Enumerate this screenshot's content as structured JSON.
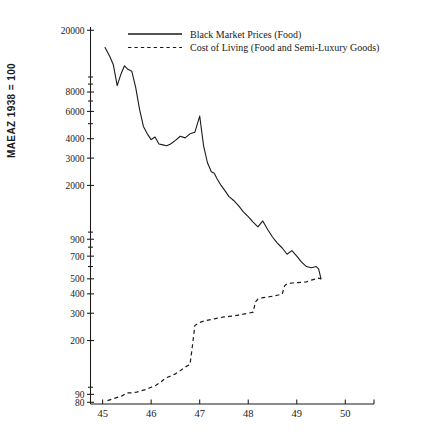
{
  "chart_data": {
    "type": "line",
    "title": "",
    "subtitle": "",
    "xlabel": "",
    "ylabel": "MAEAZ 1938 = 100",
    "yscale": "log",
    "xlim": [
      44.75,
      50.2
    ],
    "ylim": [
      78,
      21000
    ],
    "grid": false,
    "legend_position": "top-center",
    "x_ticks": [
      "45",
      "46",
      "47",
      "48",
      "49",
      "50"
    ],
    "x_tick_values": [
      45,
      46,
      47,
      48,
      49,
      50
    ],
    "y_ticks": [
      "20000",
      "8000",
      "6000",
      "4000",
      "3000",
      "2000",
      "900",
      "700",
      "500",
      "400",
      "300",
      "200",
      "90",
      "80"
    ],
    "y_tick_values": [
      20000,
      8000,
      6000,
      4000,
      3000,
      2000,
      900,
      700,
      500,
      400,
      300,
      200,
      90,
      80
    ],
    "y_minor_tick_values": [
      10000,
      9000,
      7000,
      5000,
      1000,
      800,
      600,
      100
    ],
    "series": [
      {
        "name": "Black Market Prices (Food)",
        "style": "solid",
        "color": "#1a1a1a",
        "x": [
          45.05,
          45.15,
          45.22,
          45.3,
          45.38,
          45.45,
          45.52,
          45.6,
          45.68,
          45.76,
          45.84,
          45.92,
          46.0,
          46.08,
          46.16,
          46.24,
          46.32,
          46.4,
          46.5,
          46.6,
          46.7,
          46.8,
          46.9,
          47.0,
          47.08,
          47.16,
          47.24,
          47.3,
          47.36,
          47.44,
          47.52,
          47.6,
          47.7,
          47.8,
          47.9,
          48.0,
          48.1,
          48.2,
          48.3,
          48.4,
          48.5,
          48.6,
          48.7,
          48.8,
          48.9,
          49.0,
          49.1,
          49.2,
          49.3,
          49.4,
          49.45,
          49.5
        ],
        "y": [
          15500,
          13500,
          12000,
          8800,
          10500,
          11800,
          11200,
          10900,
          8600,
          6200,
          4800,
          4300,
          3950,
          4100,
          3700,
          3650,
          3600,
          3700,
          3900,
          4150,
          4050,
          4300,
          4400,
          5600,
          3600,
          2800,
          2450,
          2400,
          2200,
          2000,
          1850,
          1700,
          1600,
          1480,
          1350,
          1260,
          1160,
          1080,
          1180,
          1040,
          930,
          850,
          790,
          720,
          760,
          700,
          640,
          600,
          590,
          600,
          580,
          500
        ]
      },
      {
        "name": "Cost of Living (Food and Semi-Luxury Goods)",
        "style": "dashed",
        "color": "#1a1a1a",
        "x": [
          45.1,
          45.2,
          45.3,
          45.4,
          45.5,
          45.6,
          45.7,
          45.8,
          45.9,
          46.0,
          46.1,
          46.2,
          46.3,
          46.4,
          46.5,
          46.6,
          46.7,
          46.8,
          46.85,
          46.9,
          47.0,
          47.1,
          47.2,
          47.3,
          47.4,
          47.5,
          47.6,
          47.7,
          47.8,
          47.9,
          48.0,
          48.1,
          48.15,
          48.2,
          48.3,
          48.4,
          48.5,
          48.6,
          48.7,
          48.75,
          48.8,
          48.9,
          49.0,
          49.1,
          49.2,
          49.3,
          49.4,
          49.45,
          49.5
        ],
        "y": [
          82,
          84,
          86,
          88,
          92,
          92,
          93,
          95,
          97,
          100,
          103,
          108,
          115,
          118,
          122,
          128,
          135,
          140,
          185,
          250,
          262,
          268,
          272,
          276,
          280,
          284,
          286,
          288,
          292,
          296,
          300,
          305,
          355,
          370,
          378,
          382,
          386,
          392,
          398,
          450,
          465,
          470,
          472,
          474,
          478,
          490,
          500,
          505,
          500
        ]
      }
    ],
    "annotations": []
  },
  "legend": {
    "entries": [
      {
        "label": "Black Market Prices (Food)",
        "style": "solid"
      },
      {
        "label": "Cost of Living (Food and Semi-Luxury Goods)",
        "style": "dashed"
      }
    ]
  },
  "axes": {
    "y_title": "MAEAZ 1938 = 100"
  }
}
